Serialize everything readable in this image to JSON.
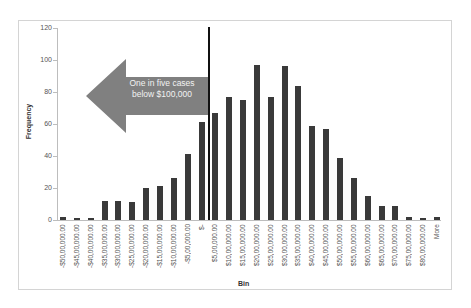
{
  "chart_data": {
    "type": "bar",
    "title": "",
    "xlabel": "Bin",
    "ylabel": "Frequency",
    "ylim": [
      0,
      120
    ],
    "yticks": [
      0,
      20,
      40,
      60,
      80,
      100,
      120
    ],
    "grid": false,
    "legend": null,
    "categories": [
      "-$50,00,000.00",
      "-$45,00,000.00",
      "-$40,00,000.00",
      "-$35,00,000.00",
      "-$30,00,000.00",
      "-$25,00,000.00",
      "-$20,00,000.00",
      "-$15,00,000.00",
      "-$10,00,000.00",
      "-$5,00,000.00",
      "$-",
      "$5,00,000.00",
      "$10,00,000.00",
      "$15,00,000.00",
      "$20,00,000.00",
      "$25,00,000.00",
      "$30,00,000.00",
      "$35,00,000.00",
      "$40,00,000.00",
      "$45,00,000.00",
      "$50,00,000.00",
      "$55,00,000.00",
      "$60,00,000.00",
      "$65,00,000.00",
      "$70,00,000.00",
      "$75,00,000.00",
      "$80,00,000.00",
      "More"
    ],
    "values": [
      2,
      1,
      1,
      12,
      12,
      11,
      20,
      21,
      26,
      41,
      61,
      67,
      77,
      75,
      97,
      77,
      96,
      84,
      59,
      57,
      39,
      26,
      15,
      9,
      9,
      2,
      1,
      2
    ],
    "annotations": [
      {
        "type": "vertical-line",
        "position": "between -$5,00,000.00 and $5,00,000.00 bins",
        "height": 120
      },
      {
        "type": "arrow-left",
        "text": "One in five cases below $100,000",
        "color": "#808080"
      }
    ]
  },
  "annotation": {
    "line1": "One in five cases",
    "line2": "below $100,000"
  },
  "colors": {
    "bar": "#3a3a3a",
    "arrow": "#808080",
    "marker": "#111111"
  }
}
